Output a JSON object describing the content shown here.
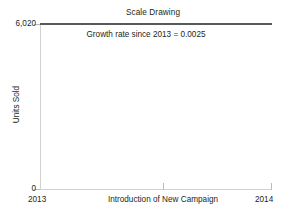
{
  "chart_data": {
    "type": "line",
    "title": "Scale Drawing",
    "xlabel": "Introduction of New Campaign",
    "ylabel": "Units Sold",
    "x": [
      "2013",
      "2014"
    ],
    "xticklabels": [
      "2013",
      "2014"
    ],
    "yticklabels": [
      "6,020",
      "0"
    ],
    "ylim": [
      0,
      6020
    ],
    "grid": false,
    "legend": "none",
    "annotation": "Growth rate since 2013 = 0.0025",
    "series": [
      {
        "name": "Units Sold",
        "values": [
          6005,
          6020
        ],
        "color": "#58595b"
      }
    ],
    "colors": {
      "series": "#58595b",
      "axis": "#d2d2d2",
      "tick": "#b9b9b9",
      "text": "#231f20",
      "background": "#ffffff"
    }
  },
  "chart": {
    "title": "Scale Drawing",
    "annotation": "Growth rate since 2013 = 0.0025",
    "y_axis": {
      "title": "Units Sold",
      "top_tick": "6,020",
      "bottom_tick": "0"
    },
    "x_axis": {
      "title": "Introduction of New Campaign",
      "left_tick": "2013",
      "right_tick": "2014"
    }
  }
}
